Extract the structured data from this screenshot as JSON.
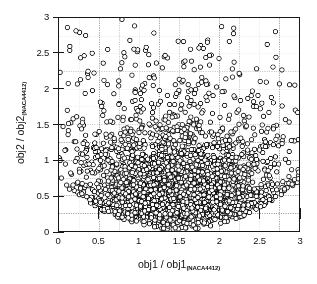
{
  "figure": {
    "background": "#ffffff",
    "frame_color": "#171717",
    "grid_color": "#8a8a8a"
  },
  "axis": {
    "x_title_main": "obj1 / obj1",
    "x_title_sub": "(NACA4412)",
    "y_title_main": "obj2 / obj2",
    "y_title_sub": "(NACA4412)"
  },
  "chart_data": {
    "type": "scatter",
    "title": "",
    "xlabel": "obj1 / obj1 (NACA4412)",
    "ylabel": "obj2 / obj2 (NACA4412)",
    "xlim": [
      0,
      3
    ],
    "ylim": [
      0,
      3
    ],
    "xticks": [
      0,
      0.5,
      1,
      1.5,
      2,
      2.5,
      3
    ],
    "yticks": [
      0,
      0.5,
      1,
      1.5,
      2,
      2.5,
      3
    ],
    "xticklabels": [
      "0",
      "0.5",
      "1",
      "1.5",
      "2",
      "2.5",
      "3"
    ],
    "yticklabels": [
      "0",
      "0.5",
      "1",
      "1.5",
      "2",
      "2.5",
      "3"
    ],
    "grid": true,
    "grid_interval": 0.25,
    "grid_style": "dotted",
    "legend": "none",
    "marker": {
      "shape": "circle-open",
      "edge_color": "#111111",
      "face_color": "#ffffff",
      "size_px": 4.4,
      "line_width": 0.85
    },
    "n_points": 3200,
    "series": [
      {
        "name": "design-population",
        "description": "Dense saturated cluster in the lower-central region thinning outward into sparse scattered points",
        "distribution": {
          "core": {
            "weight": 0.74,
            "x_center": 1.52,
            "y_center": 0.42,
            "x_spread": 0.52,
            "y_spread": 0.3,
            "y_floor": 0.0
          },
          "mid": {
            "weight": 0.19,
            "x_center": 1.45,
            "y_center": 1.05,
            "x_spread": 0.74,
            "y_spread": 0.38
          },
          "tail": {
            "weight": 0.07,
            "x_center": 1.35,
            "y_center": 1.95,
            "x_spread": 0.85,
            "y_spread": 0.52
          }
        }
      }
    ]
  }
}
